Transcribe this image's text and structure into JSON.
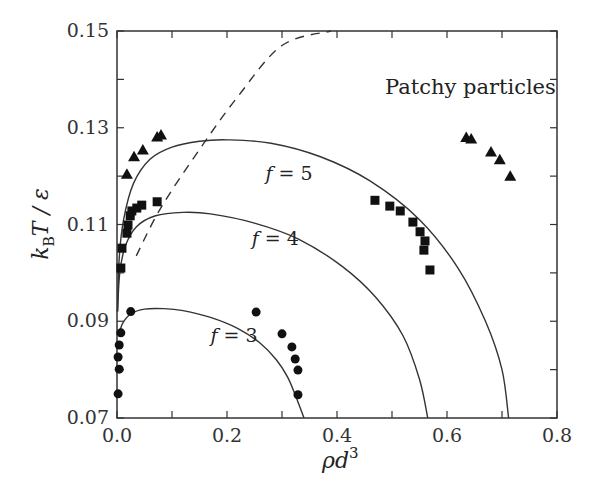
{
  "chart_data": {
    "type": "scatter",
    "title": "",
    "annotation": "Patchy particles",
    "xlabel": "ρd³",
    "ylabel": "k_B T / ε",
    "xlim": [
      0.0,
      0.8
    ],
    "ylim": [
      0.07,
      0.15
    ],
    "x_ticks": [
      "0.0",
      "0.2",
      "0.4",
      "0.6",
      "0.8"
    ],
    "x_tick_values": [
      0.0,
      0.2,
      0.4,
      0.6,
      0.8
    ],
    "x_minor_ticks": [
      0.1,
      0.3,
      0.5,
      0.7
    ],
    "y_ticks": [
      "0.07",
      "0.09",
      "0.11",
      "0.13",
      "0.15"
    ],
    "y_tick_values": [
      0.07,
      0.09,
      0.11,
      0.13,
      0.15
    ],
    "y_minor_ticks": [
      0.08,
      0.1,
      0.12,
      0.14
    ],
    "grid": false,
    "series": [
      {
        "name": "f = 3 (simulation)",
        "marker": "circle",
        "points": [
          [
            0.025,
            0.092
          ],
          [
            0.007,
            0.0876
          ],
          [
            0.004,
            0.0851
          ],
          [
            0.002,
            0.0826
          ],
          [
            0.004,
            0.0801
          ],
          [
            0.002,
            0.075
          ],
          [
            0.253,
            0.0919
          ],
          [
            0.3,
            0.0874
          ],
          [
            0.318,
            0.0847
          ],
          [
            0.324,
            0.0822
          ],
          [
            0.329,
            0.0799
          ],
          [
            0.329,
            0.0748
          ]
        ]
      },
      {
        "name": "f = 4 (simulation)",
        "marker": "square",
        "points": [
          [
            0.007,
            0.101
          ],
          [
            0.009,
            0.1051
          ],
          [
            0.018,
            0.1082
          ],
          [
            0.02,
            0.1099
          ],
          [
            0.024,
            0.1118
          ],
          [
            0.027,
            0.1128
          ],
          [
            0.036,
            0.1134
          ],
          [
            0.045,
            0.114
          ],
          [
            0.073,
            0.1147
          ],
          [
            0.469,
            0.115
          ],
          [
            0.496,
            0.1138
          ],
          [
            0.515,
            0.1128
          ],
          [
            0.538,
            0.1105
          ],
          [
            0.551,
            0.1085
          ],
          [
            0.56,
            0.1066
          ],
          [
            0.558,
            0.1047
          ],
          [
            0.569,
            0.1006
          ]
        ]
      },
      {
        "name": "f = 5 (simulation)",
        "marker": "triangle",
        "points": [
          [
            0.018,
            0.1204
          ],
          [
            0.031,
            0.124
          ],
          [
            0.047,
            0.1254
          ],
          [
            0.073,
            0.1281
          ],
          [
            0.08,
            0.1285
          ],
          [
            0.635,
            0.128
          ],
          [
            0.644,
            0.1277
          ],
          [
            0.68,
            0.125
          ],
          [
            0.696,
            0.1234
          ],
          [
            0.715,
            0.12
          ]
        ]
      },
      {
        "name": "f = 3 (theory)",
        "line": "solid",
        "label": "f = 3",
        "label_pos": [
          0.17,
          0.0858
        ],
        "points": [
          [
            0.003,
            0.0869
          ],
          [
            0.01,
            0.0895
          ],
          [
            0.025,
            0.0915
          ],
          [
            0.05,
            0.0925
          ],
          [
            0.085,
            0.0926
          ],
          [
            0.12,
            0.0922
          ],
          [
            0.17,
            0.0908
          ],
          [
            0.22,
            0.0885
          ],
          [
            0.26,
            0.0855
          ],
          [
            0.29,
            0.082
          ],
          [
            0.31,
            0.0785
          ],
          [
            0.325,
            0.0745
          ],
          [
            0.34,
            0.07
          ]
        ]
      },
      {
        "name": "f = 4 (theory)",
        "line": "solid",
        "label": "f = 4",
        "label_pos": [
          0.245,
          0.1058
        ],
        "points": [
          [
            0.001,
            0.092
          ],
          [
            0.005,
            0.1
          ],
          [
            0.015,
            0.1055
          ],
          [
            0.035,
            0.1095
          ],
          [
            0.07,
            0.1118
          ],
          [
            0.12,
            0.1125
          ],
          [
            0.17,
            0.1122
          ],
          [
            0.25,
            0.1103
          ],
          [
            0.33,
            0.107
          ],
          [
            0.41,
            0.1013
          ],
          [
            0.47,
            0.095
          ],
          [
            0.52,
            0.087
          ],
          [
            0.55,
            0.078
          ],
          [
            0.565,
            0.07
          ]
        ]
      },
      {
        "name": "f = 5 (theory)",
        "line": "solid",
        "label": "f = 5",
        "label_pos": [
          0.27,
          0.1193
        ],
        "points": [
          [
            0.001,
            0.092
          ],
          [
            0.004,
            0.103
          ],
          [
            0.012,
            0.111
          ],
          [
            0.03,
            0.1185
          ],
          [
            0.06,
            0.1235
          ],
          [
            0.1,
            0.126
          ],
          [
            0.15,
            0.1272
          ],
          [
            0.2,
            0.1275
          ],
          [
            0.28,
            0.1268
          ],
          [
            0.37,
            0.124
          ],
          [
            0.46,
            0.119
          ],
          [
            0.55,
            0.111
          ],
          [
            0.62,
            0.101
          ],
          [
            0.67,
            0.09
          ],
          [
            0.7,
            0.08
          ],
          [
            0.712,
            0.07
          ]
        ]
      },
      {
        "name": "boundary (dashed)",
        "line": "dashed",
        "points": [
          [
            0.035,
            0.1035
          ],
          [
            0.08,
            0.1135
          ],
          [
            0.15,
            0.1255
          ],
          [
            0.22,
            0.1365
          ],
          [
            0.3,
            0.147
          ],
          [
            0.389,
            0.15
          ]
        ]
      }
    ]
  }
}
